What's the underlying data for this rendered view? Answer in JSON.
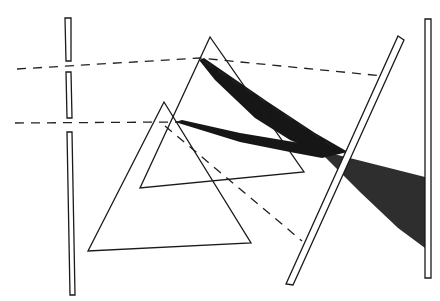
{
  "diagram": {
    "labels": [],
    "colors": {
      "background": "#ffffff",
      "line": "#1a1a1a",
      "beam": "#161616",
      "spread": "#2e2e2e"
    },
    "elements": [
      {
        "name": "slit-barrier",
        "segments": 3
      },
      {
        "name": "upper-incident-ray",
        "style": "dashed"
      },
      {
        "name": "lower-incident-ray",
        "style": "dashed"
      },
      {
        "name": "large-prism",
        "shape": "triangle"
      },
      {
        "name": "small-prism",
        "shape": "triangle"
      },
      {
        "name": "upper-dark-beam",
        "style": "filled"
      },
      {
        "name": "lower-dark-beam",
        "style": "filled"
      },
      {
        "name": "spreading-beam",
        "style": "filled"
      },
      {
        "name": "angled-plate",
        "shape": "tilted-rectangle"
      },
      {
        "name": "projection-screen",
        "shape": "rectangle"
      }
    ]
  }
}
